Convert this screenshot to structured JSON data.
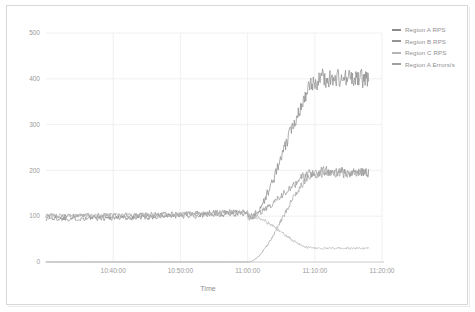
{
  "chart_data": {
    "type": "line",
    "title": "",
    "xlabel": "Time",
    "ylabel": "",
    "xlim": [
      0,
      3000
    ],
    "ylim": [
      0,
      500
    ],
    "grid": true,
    "legend_position": "right",
    "y_ticks": [
      0,
      100,
      200,
      300,
      400,
      500
    ],
    "y_tick_labels": [
      "0",
      "100",
      "200",
      "300",
      "400",
      "500"
    ],
    "x_tick_labels": [
      "10:40:00",
      "10:50:00",
      "11:00:00",
      "11:10:00",
      "11:20:00"
    ],
    "x_tick_values": [
      600,
      1200,
      1800,
      2400,
      3000
    ],
    "series": [
      {
        "name": "Region A RPS",
        "color": "#8a8a8a",
        "baseline": 95,
        "plateau": 400,
        "ramp_start": 1800,
        "ramp_end": 2460,
        "noise_baseline": 7,
        "noise_plateau": 26
      },
      {
        "name": "Region B RPS",
        "color": "#949494",
        "baseline": 100,
        "plateau": 196,
        "ramp_start": 1800,
        "ramp_end": 2430,
        "noise_baseline": 7,
        "noise_plateau": 14
      },
      {
        "name": "Region C RPS",
        "color": "#b4b4b4",
        "baseline": 101,
        "plateau": 30,
        "ramp_start": 1800,
        "ramp_end": 2400,
        "noise_baseline": 6,
        "noise_plateau": 3
      },
      {
        "name": "Region A Errors/s",
        "color": "#a0a0a0",
        "baseline": 0,
        "plateau": 195,
        "ramp_start": 1800,
        "ramp_end": 2430,
        "noise_baseline": 0,
        "noise_plateau": 12
      }
    ]
  },
  "axes": {
    "x_title": "Time",
    "y_tick_labels": [
      "500",
      "400",
      "300",
      "200",
      "100",
      "0"
    ],
    "x_tick_labels": [
      "10:40:00",
      "10:50:00",
      "11:00:00",
      "11:10:00",
      "11:20:00"
    ]
  },
  "legend": {
    "items": [
      {
        "label": "Region A RPS",
        "color": "#8a8a8a"
      },
      {
        "label": "Region B RPS",
        "color": "#949494"
      },
      {
        "label": "Region C RPS",
        "color": "#b4b4b4"
      },
      {
        "label": "Region A Errors/s",
        "color": "#a0a0a0"
      }
    ]
  },
  "colors": {
    "background": "#ffffff",
    "frame": "#d8d8d8",
    "grid": "#ececec",
    "axis_line": "#c4c4c4",
    "tick_text": "#9a9a9a"
  }
}
